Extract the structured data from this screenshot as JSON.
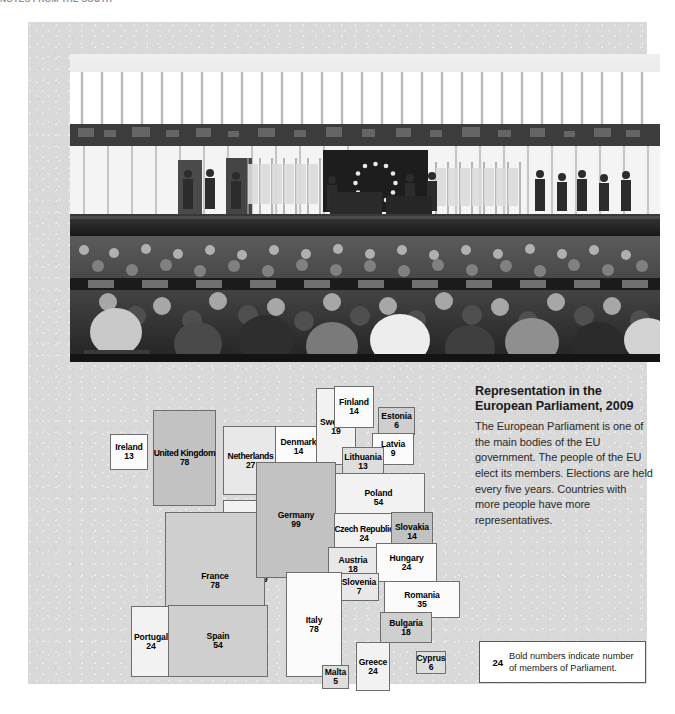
{
  "running_header": "NOTES FROM THE SOUTH",
  "photo": {
    "caption_alt": "European Parliament chamber in session",
    "screen_icon": "eu-flag-screen"
  },
  "info": {
    "title": "Representation in the European Parliament, 2009",
    "body": "The European Parliament is one of the main bodies of the EU government. The people of the EU elect its members. Elections are held every five years. Countries with more people have more representatives."
  },
  "legend": {
    "sample_number": "24",
    "text": "Bold numbers indicate number of members of Parliament."
  },
  "chart_data": {
    "type": "cartogram",
    "title": "Representation in the European Parliament, 2009",
    "value_label": "members of Parliament",
    "total_members": 736,
    "categories": [
      "Ireland",
      "United Kingdom",
      "Netherlands",
      "Belgium",
      "Luxembourg",
      "France",
      "Portugal",
      "Spain",
      "Denmark",
      "Sweden",
      "Finland",
      "Estonia",
      "Latvia",
      "Lithuania",
      "Poland",
      "Germany",
      "Czech Republic",
      "Slovakia",
      "Austria",
      "Hungary",
      "Slovenia",
      "Romania",
      "Bulgaria",
      "Italy",
      "Malta",
      "Greece",
      "Cyprus"
    ],
    "values": [
      13,
      78,
      27,
      24,
      6,
      78,
      24,
      54,
      14,
      19,
      14,
      6,
      9,
      13,
      54,
      99,
      24,
      14,
      18,
      24,
      7,
      35,
      18,
      78,
      5,
      24,
      6
    ],
    "countries": [
      {
        "name": "Ireland",
        "value": "13",
        "x": 82,
        "y": 412,
        "w": 38,
        "h": 36,
        "tone": "t0"
      },
      {
        "name": "United Kingdom",
        "value": "78",
        "x": 125,
        "y": 388,
        "w": 63,
        "h": 96,
        "tone": "t5"
      },
      {
        "name": "Netherlands",
        "value": "27",
        "x": 195,
        "y": 404,
        "w": 55,
        "h": 69,
        "tone": "t2"
      },
      {
        "name": "Belgium",
        "value": "24",
        "x": 195,
        "y": 478,
        "w": 55,
        "h": 65,
        "tone": "t1"
      },
      {
        "name": "Luxembourg",
        "value": "6",
        "x": 195,
        "y": 545,
        "w": 40,
        "h": 30,
        "tone": "t0"
      },
      {
        "name": "France",
        "value": "78",
        "x": 137,
        "y": 490,
        "w": 100,
        "h": 138,
        "tone": "t4"
      },
      {
        "name": "Portugal",
        "value": "24",
        "x": 103,
        "y": 584,
        "w": 40,
        "h": 71,
        "tone": "t1"
      },
      {
        "name": "Spain",
        "value": "54",
        "x": 140,
        "y": 583,
        "w": 100,
        "h": 72,
        "tone": "t4"
      },
      {
        "name": "Denmark",
        "value": "14",
        "x": 247,
        "y": 404,
        "w": 47,
        "h": 42,
        "tone": "t0"
      },
      {
        "name": "Sweden",
        "value": "19",
        "x": 288,
        "y": 366,
        "w": 40,
        "h": 77,
        "tone": "t1"
      },
      {
        "name": "Finland",
        "value": "14",
        "x": 306,
        "y": 364,
        "w": 40,
        "h": 42,
        "tone": "t0"
      },
      {
        "name": "Estonia",
        "value": "6",
        "x": 350,
        "y": 385,
        "w": 37,
        "h": 28,
        "tone": "t4"
      },
      {
        "name": "Latvia",
        "value": "9",
        "x": 344,
        "y": 411,
        "w": 42,
        "h": 32,
        "tone": "t0"
      },
      {
        "name": "Lithuania",
        "value": "13",
        "x": 314,
        "y": 425,
        "w": 42,
        "h": 30,
        "tone": "t3"
      },
      {
        "name": "Poland",
        "value": "54",
        "x": 304,
        "y": 451,
        "w": 93,
        "h": 49,
        "tone": "t1"
      },
      {
        "name": "Germany",
        "value": "99",
        "x": 228,
        "y": 440,
        "w": 80,
        "h": 116,
        "tone": "t5"
      },
      {
        "name": "Czech Republic",
        "value": "24",
        "x": 306,
        "y": 491,
        "w": 60,
        "h": 41,
        "tone": "t1"
      },
      {
        "name": "Slovakia",
        "value": "14",
        "x": 363,
        "y": 490,
        "w": 42,
        "h": 39,
        "tone": "t5"
      },
      {
        "name": "Austria",
        "value": "18",
        "x": 300,
        "y": 525,
        "w": 50,
        "h": 35,
        "tone": "t2"
      },
      {
        "name": "Hungary",
        "value": "24",
        "x": 348,
        "y": 521,
        "w": 61,
        "h": 39,
        "tone": "t0"
      },
      {
        "name": "Slovenia",
        "value": "7",
        "x": 311,
        "y": 551,
        "w": 40,
        "h": 28,
        "tone": "t2"
      },
      {
        "name": "Romania",
        "value": "35",
        "x": 356,
        "y": 559,
        "w": 76,
        "h": 37,
        "tone": "t0"
      },
      {
        "name": "Bulgaria",
        "value": "18",
        "x": 352,
        "y": 590,
        "w": 52,
        "h": 31,
        "tone": "t4"
      },
      {
        "name": "Italy",
        "value": "78",
        "x": 258,
        "y": 550,
        "w": 56,
        "h": 105,
        "tone": "t0"
      },
      {
        "name": "Malta",
        "value": "5",
        "x": 294,
        "y": 643,
        "w": 27,
        "h": 24,
        "tone": "t3"
      },
      {
        "name": "Greece",
        "value": "24",
        "x": 328,
        "y": 620,
        "w": 34,
        "h": 49,
        "tone": "t1"
      },
      {
        "name": "Cyprus",
        "value": "6",
        "x": 388,
        "y": 629,
        "w": 30,
        "h": 23,
        "tone": "t3"
      }
    ]
  }
}
